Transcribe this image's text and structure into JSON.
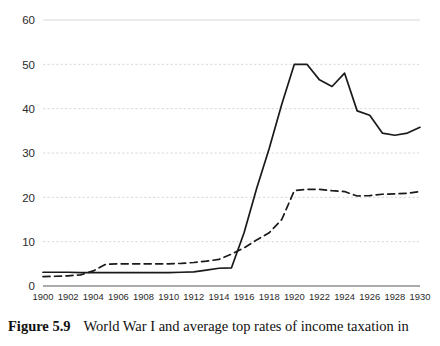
{
  "figure": {
    "caption_label": "Figure 5.9",
    "caption_text": "World War I and average top rates of income taxation in"
  },
  "legend": {
    "position": "below-axis",
    "entries": [
      {
        "name": "mobilization",
        "label": "Mobilization countries",
        "style": "solid",
        "color": "#1a1a1a"
      },
      {
        "name": "nonmobilization",
        "label": "Nonmobilization countries",
        "style": "dashed",
        "color": "#1a1a1a"
      }
    ]
  },
  "axes": {
    "y_ticks": [
      "0",
      "10",
      "20",
      "30",
      "40",
      "50",
      "60"
    ],
    "x_ticks": [
      "1900",
      "1902",
      "1904",
      "1906",
      "1908",
      "1910",
      "1912",
      "1914",
      "1916",
      "1918",
      "1920",
      "1922",
      "1924",
      "1926",
      "1928",
      "1930"
    ],
    "grid_color": "#d8d8d8",
    "axis_color": "#8f8f8f"
  },
  "chart_data": {
    "type": "line",
    "title": "",
    "xlabel": "",
    "ylabel": "",
    "xlim": [
      1900,
      1930
    ],
    "ylim": [
      0,
      60
    ],
    "grid": true,
    "legend_position": "below-axis",
    "x": [
      1900,
      1901,
      1902,
      1903,
      1904,
      1905,
      1906,
      1907,
      1908,
      1909,
      1910,
      1911,
      1912,
      1913,
      1914,
      1915,
      1916,
      1917,
      1918,
      1919,
      1920,
      1921,
      1922,
      1923,
      1924,
      1925,
      1926,
      1927,
      1928,
      1929,
      1930
    ],
    "series": [
      {
        "name": "Mobilization countries",
        "style": "solid",
        "color": "#1a1a1a",
        "values": [
          3.1,
          3.1,
          3.1,
          3.0,
          3.0,
          3.0,
          3.0,
          3.0,
          3.0,
          3.0,
          3.0,
          3.1,
          3.2,
          3.6,
          4.0,
          4.1,
          12.0,
          22.0,
          31.0,
          41.0,
          50.0,
          50.0,
          46.5,
          45.0,
          48.0,
          39.5,
          38.5,
          34.5,
          34.0,
          34.5,
          35.8
        ]
      },
      {
        "name": "Nonmobilization countries",
        "style": "dashed",
        "color": "#1a1a1a",
        "values": [
          2.1,
          2.2,
          2.3,
          2.5,
          3.4,
          4.9,
          5.0,
          5.0,
          5.0,
          5.0,
          5.0,
          5.1,
          5.3,
          5.6,
          6.0,
          7.2,
          8.6,
          10.4,
          12.0,
          15.0,
          21.5,
          21.8,
          21.8,
          21.5,
          21.3,
          20.3,
          20.4,
          20.7,
          20.8,
          20.9,
          21.3
        ]
      }
    ]
  }
}
